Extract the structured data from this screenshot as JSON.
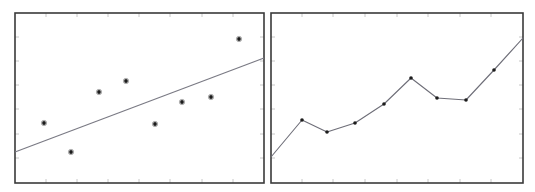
{
  "figure": {
    "width": 535,
    "height": 192,
    "background_color": "#ffffff",
    "panel_count": 2
  },
  "style": {
    "axis_color": "#3a3a3a",
    "axis_width": 1.6,
    "tick_color": "#b8b8b8",
    "tick_width": 0.9,
    "tick_length": 4,
    "marker_color": "#1c1c1c",
    "marker_radius": 1.9,
    "marker_halo_color": "#8a8a8a",
    "line_color": "#6e6e78",
    "line_width": 1.1,
    "trend_line_color": "#7a7a84",
    "trend_line_width": 1.2
  },
  "chart_data": [
    {
      "type": "scatter",
      "title": "",
      "subtitle": "",
      "xlabel": "",
      "ylabel": "",
      "legend": [],
      "annotations": [],
      "grid": false,
      "legend_position": "none",
      "panel_index": 0,
      "panel_label": "left-panel",
      "description": "Scatter plot of 8 points with an overlaid upward-sloping fitted trend line",
      "axis_ticks_visible": true,
      "x_tick_count": 8,
      "y_tick_count": 7,
      "xlim": [
        0,
        1
      ],
      "ylim": [
        0,
        1
      ],
      "plot_box_px": {
        "x0": 15,
        "y0": 13,
        "x1": 264,
        "y1": 183
      },
      "x": [
        0.117,
        0.225,
        0.337,
        0.446,
        0.562,
        0.671,
        0.787,
        0.9
      ],
      "y": [
        0.647,
        0.476,
        0.835,
        0.9,
        0.347,
        0.476,
        0.506,
        0.847
      ],
      "points_px": [
        {
          "x": 44,
          "y": 123
        },
        {
          "x": 71,
          "y": 152
        },
        {
          "x": 99,
          "y": 92
        },
        {
          "x": 126,
          "y": 81
        },
        {
          "x": 155,
          "y": 124
        },
        {
          "x": 182,
          "y": 102
        },
        {
          "x": 211,
          "y": 97
        },
        {
          "x": 239,
          "y": 39
        }
      ],
      "trend_line": {
        "name": "fitted line",
        "x": [
          0.0,
          1.0
        ],
        "y": [
          0.182,
          0.735
        ],
        "points_px": [
          {
            "x": 15,
            "y": 183
          },
          {
            "x": 264,
            "y": 58
          }
        ],
        "start_px": {
          "x": 15,
          "y": 152
        },
        "end_px": {
          "x": 264,
          "y": 58
        }
      }
    },
    {
      "type": "line",
      "title": "",
      "subtitle": "",
      "xlabel": "",
      "ylabel": "",
      "legend": [],
      "annotations": [],
      "grid": false,
      "legend_position": "none",
      "panel_index": 1,
      "panel_label": "right-panel",
      "description": "Connected line chart with point markers showing an overall rising zigzag trend",
      "axis_ticks_visible": true,
      "x_tick_count": 8,
      "y_tick_count": 7,
      "xlim": [
        0,
        1
      ],
      "ylim": [
        0,
        1
      ],
      "plot_box_px": {
        "x0": 271,
        "y0": 13,
        "x1": 523,
        "y1": 183
      },
      "series": [
        {
          "name": "series-1",
          "x": [
            0.0,
            0.123,
            0.222,
            0.333,
            0.448,
            0.556,
            0.659,
            0.774,
            0.885,
            1.0
          ],
          "y": [
            0.153,
            0.371,
            0.3,
            0.353,
            0.465,
            0.618,
            0.5,
            0.488,
            0.665,
            0.853
          ],
          "values": [
            0.153,
            0.371,
            0.3,
            0.353,
            0.465,
            0.618,
            0.5,
            0.488,
            0.665,
            0.853
          ],
          "points_px": [
            {
              "x": 271,
              "y": 157
            },
            {
              "x": 302,
              "y": 120
            },
            {
              "x": 327,
              "y": 132
            },
            {
              "x": 355,
              "y": 123
            },
            {
              "x": 384,
              "y": 104
            },
            {
              "x": 411,
              "y": 78
            },
            {
              "x": 437,
              "y": 98
            },
            {
              "x": 466,
              "y": 100
            },
            {
              "x": 494,
              "y": 70
            },
            {
              "x": 523,
              "y": 38
            }
          ],
          "marker_indices": [
            1,
            2,
            3,
            4,
            5,
            6,
            7,
            8
          ]
        }
      ]
    }
  ]
}
